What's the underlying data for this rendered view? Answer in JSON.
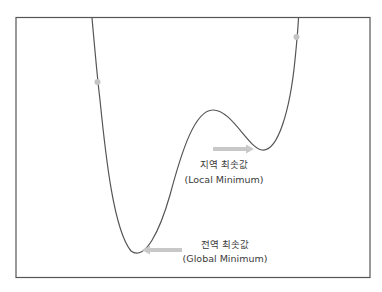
{
  "diagram": {
    "title": "",
    "curve_description": "loss function curve with a global minimum and a local minimum",
    "colors": {
      "frame": "#555555",
      "curve": "#555555",
      "arrow": "#c8c8c8",
      "dot": "#c4c4c4",
      "text": "#3a3a3a"
    },
    "local_minimum": {
      "label_ko": "지역 최솟값",
      "label_en": "(Local Minimum)"
    },
    "global_minimum": {
      "label_ko": "전역 최솟값",
      "label_en": "(Global Minimum)"
    },
    "markers": [
      {
        "name": "start-point-left"
      },
      {
        "name": "start-point-right"
      }
    ]
  }
}
